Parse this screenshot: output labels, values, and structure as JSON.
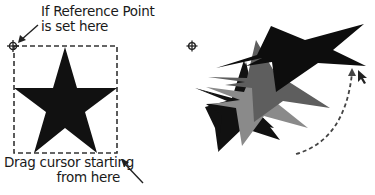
{
  "left_panel": {
    "reference_label": {
      "line1": "If Reference Point",
      "line2": "is set here"
    },
    "drag_label": {
      "line1": "Drag cursor starting",
      "line2": "from here"
    },
    "reference_point_icon": "crosshair-target-icon",
    "selection_box": "dashed-bounding-box",
    "shape": "black five-point star"
  },
  "right_panel": {
    "reference_point_icon": "crosshair-target-icon",
    "shapes": [
      {
        "name": "original-star",
        "color": "#111111"
      },
      {
        "name": "rotated-star-1",
        "color": "#8a8a8a"
      },
      {
        "name": "rotated-star-2",
        "color": "#5e5e5e"
      },
      {
        "name": "rotated-star-3",
        "color": "#0d0d0d"
      }
    ],
    "drag_path": "dashed curved arrow",
    "cursor_icon": "arrow-cursor-icon"
  },
  "colors": {
    "black": "#111111",
    "light_gray": "#8a8a8a",
    "dark_gray": "#5e5e5e",
    "dash": "#333333"
  }
}
